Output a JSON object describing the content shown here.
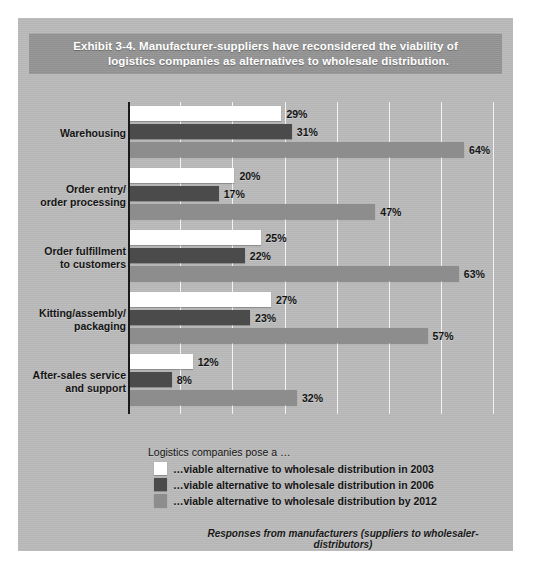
{
  "exhibit": {
    "title_line1": "Exhibit 3-4. Manufacturer-suppliers have reconsidered the viability of",
    "title_line2": "logistics companies as alternatives to wholesale distribution.",
    "legend_title": "Logistics companies pose a …",
    "footnote": "Responses from manufacturers (suppliers to wholesaler-distributors)"
  },
  "chart_data": {
    "type": "bar",
    "orientation": "horizontal",
    "title": "Exhibit 3-4. Manufacturer-suppliers have reconsidered the viability of logistics companies as alternatives to wholesale distribution.",
    "xlabel": "",
    "ylabel": "",
    "xlim": [
      0,
      70
    ],
    "grid": true,
    "gridlines": [
      10,
      20,
      30,
      40,
      50,
      60,
      70
    ],
    "value_suffix": "%",
    "legend_position": "bottom-left",
    "categories": [
      "Warehousing",
      "Order entry/\norder processing",
      "Order fulfillment\nto customers",
      "Kitting/assembly/\npackaging",
      "After-sales service\nand support"
    ],
    "series": [
      {
        "name": "…viable alternative to wholesale distribution in 2003",
        "color": "#ffffff",
        "values": [
          29,
          20,
          25,
          27,
          12
        ],
        "labels": [
          "29%",
          "20%",
          "25%",
          "27%",
          "12%"
        ]
      },
      {
        "name": "…viable alternative to wholesale distribution in 2006",
        "color": "#4b4b4b",
        "values": [
          31,
          17,
          22,
          23,
          8
        ],
        "labels": [
          "31%",
          "17%",
          "22%",
          "23%",
          "8%"
        ]
      },
      {
        "name": "…viable alternative to wholesale distribution by 2012",
        "color": "#8d8d8d",
        "values": [
          64,
          47,
          63,
          57,
          32
        ],
        "labels": [
          "64%",
          "47%",
          "63%",
          "57%",
          "32%"
        ]
      }
    ]
  }
}
